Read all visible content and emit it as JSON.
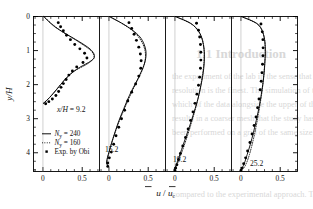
{
  "figure": {
    "background_color": "#ffffff",
    "line_color": "#000000",
    "axis_label_y": "y/H",
    "axis_label_x_num": "u",
    "axis_label_x_den": "u",
    "axis_label_x_den_sub": "c",
    "axis_label_x_slash": "/"
  },
  "axes": {
    "y_ticks": [
      "0",
      "1",
      "2",
      "3",
      "4"
    ],
    "y_tick_values": [
      0,
      1,
      2,
      3,
      4
    ],
    "y_range": [
      0,
      4.55
    ],
    "y_minor_step": 0.25,
    "x_ticks": [
      "0",
      "0.5"
    ],
    "x_tick_values": [
      0,
      0.5
    ],
    "x_range": [
      -0.12,
      0.72
    ],
    "x_minor_step": 0.1
  },
  "legend": {
    "items": [
      {
        "label_pre": "N",
        "label_sub": "y",
        "label_post": " = 240",
        "style": "solid",
        "name": "ny-240"
      },
      {
        "label_pre": "N",
        "label_sub": "y",
        "label_post": " = 160",
        "style": "dotted",
        "name": "ny-160"
      },
      {
        "label_pre": "Exp. by Obi",
        "label_sub": "",
        "label_post": "",
        "style": "marker",
        "name": "exp-obi"
      }
    ]
  },
  "chart_data": {
    "type": "line",
    "title": "",
    "xlabel": "u / u_c",
    "ylabel": "y/H",
    "xlim": [
      -0.12,
      0.72
    ],
    "ylim": [
      0,
      4.55
    ],
    "y_axis_inverted": true,
    "grid": false,
    "legend_position": "lower-left-panel-1",
    "panels": [
      {
        "name": "panel-x-9.2",
        "label_pre": "x/H",
        "label_post": " = 9.2",
        "label_full": "x/H = 9.2",
        "x_over_H": 9.2,
        "series": [
          {
            "name": "Ny = 240",
            "style": "solid",
            "y": [
              0.0,
              0.15,
              0.3,
              0.45,
              0.6,
              0.75,
              0.9,
              1.0,
              1.1,
              1.18,
              1.25,
              1.35,
              1.45,
              1.55,
              1.7,
              1.85,
              2.0,
              2.15,
              2.3,
              2.45,
              2.55
            ],
            "u": [
              0.01,
              0.075,
              0.15,
              0.25,
              0.36,
              0.47,
              0.57,
              0.62,
              0.65,
              0.655,
              0.64,
              0.58,
              0.5,
              0.43,
              0.345,
              0.28,
              0.225,
              0.17,
              0.115,
              0.055,
              0.005
            ]
          },
          {
            "name": "Ny = 160",
            "style": "dotted",
            "y": [
              0.0,
              0.2,
              0.4,
              0.6,
              0.8,
              1.0,
              1.15,
              1.25,
              1.4,
              1.6,
              1.8,
              2.0,
              2.2,
              2.4,
              2.55
            ],
            "u": [
              0.01,
              0.105,
              0.215,
              0.355,
              0.49,
              0.61,
              0.648,
              0.64,
              0.56,
              0.4,
              0.3,
              0.225,
              0.155,
              0.075,
              0.005
            ]
          },
          {
            "name": "Exp. by Obi",
            "style": "marker",
            "y": [
              0.18,
              0.3,
              0.42,
              0.55,
              0.68,
              0.82,
              0.95,
              1.08,
              1.22,
              1.35,
              1.48,
              1.6,
              1.72,
              1.85,
              1.97,
              2.08,
              2.2,
              2.32,
              2.42,
              2.5,
              2.56
            ],
            "u": [
              0.195,
              0.225,
              0.26,
              0.3,
              0.35,
              0.405,
              0.47,
              0.53,
              0.56,
              0.51,
              0.43,
              0.375,
              0.33,
              0.295,
              0.26,
              0.23,
              0.2,
              0.165,
              0.12,
              0.075,
              0.035
            ]
          }
        ]
      },
      {
        "name": "panel-x-15.2",
        "label_pre": "",
        "label_post": "15.2",
        "label_full": "15.2",
        "x_over_H": 15.2,
        "series": [
          {
            "name": "Ny = 240",
            "style": "solid",
            "y": [
              0.0,
              0.2,
              0.4,
              0.6,
              0.8,
              1.0,
              1.2,
              1.4,
              1.6,
              1.8,
              2.0,
              2.2,
              2.45,
              2.7,
              2.95,
              3.2,
              3.45,
              3.7,
              3.95,
              4.15,
              4.3,
              4.38
            ],
            "u": [
              0.005,
              0.165,
              0.3,
              0.395,
              0.445,
              0.47,
              0.47,
              0.45,
              0.415,
              0.375,
              0.33,
              0.285,
              0.235,
              0.19,
              0.145,
              0.105,
              0.07,
              0.035,
              0.005,
              -0.02,
              -0.03,
              -0.015
            ]
          },
          {
            "name": "Ny = 160",
            "style": "dotted",
            "y": [
              0.0,
              0.25,
              0.5,
              0.8,
              1.1,
              1.4,
              1.7,
              2.0,
              2.4,
              2.8,
              3.2,
              3.6,
              4.0,
              4.25,
              4.38
            ],
            "u": [
              0.005,
              0.2,
              0.34,
              0.43,
              0.465,
              0.45,
              0.4,
              0.335,
              0.255,
              0.18,
              0.11,
              0.05,
              0.0,
              -0.025,
              -0.015
            ]
          },
          {
            "name": "Exp. by Obi",
            "style": "marker",
            "y": [
              0.18,
              0.35,
              0.52,
              0.7,
              0.9,
              1.1,
              1.3,
              1.52,
              1.75,
              1.98,
              2.22,
              2.48,
              2.75,
              3.0,
              3.25,
              3.5,
              3.75,
              3.98,
              4.15,
              4.3,
              4.4
            ],
            "u": [
              0.255,
              0.29,
              0.32,
              0.35,
              0.38,
              0.4,
              0.41,
              0.405,
              0.38,
              0.34,
              0.29,
              0.24,
              0.2,
              0.16,
              0.125,
              0.09,
              0.06,
              0.03,
              0.005,
              -0.015,
              -0.015
            ]
          }
        ]
      },
      {
        "name": "panel-x-19.2",
        "label_pre": "",
        "label_post": "19.2",
        "label_full": "19.2",
        "x_over_H": 19.2,
        "series": [
          {
            "name": "Ny = 240",
            "style": "solid",
            "y": [
              0.0,
              0.2,
              0.45,
              0.7,
              0.95,
              1.2,
              1.5,
              1.8,
              2.1,
              2.4,
              2.7,
              3.0,
              3.3,
              3.6,
              3.9,
              4.15,
              4.35,
              4.48,
              4.52
            ],
            "u": [
              0.005,
              0.2,
              0.305,
              0.35,
              0.37,
              0.375,
              0.368,
              0.35,
              0.325,
              0.295,
              0.258,
              0.218,
              0.175,
              0.13,
              0.085,
              0.048,
              0.018,
              -0.01,
              -0.005
            ]
          },
          {
            "name": "Ny = 160",
            "style": "dotted",
            "y": [
              0.0,
              0.25,
              0.55,
              0.9,
              1.25,
              1.6,
              2.0,
              2.4,
              2.8,
              3.2,
              3.6,
              4.0,
              4.3,
              4.5
            ],
            "u": [
              0.005,
              0.23,
              0.33,
              0.368,
              0.372,
              0.358,
              0.33,
              0.295,
              0.25,
              0.2,
              0.145,
              0.085,
              0.035,
              -0.005
            ]
          },
          {
            "name": "Exp. by Obi",
            "style": "marker",
            "y": [
              0.2,
              0.4,
              0.6,
              0.82,
              1.05,
              1.28,
              1.52,
              1.78,
              2.02,
              2.28,
              2.55,
              2.8,
              3.05,
              3.3,
              3.55,
              3.8,
              4.02,
              4.2,
              4.35,
              4.45,
              4.52
            ],
            "u": [
              0.275,
              0.3,
              0.315,
              0.325,
              0.33,
              0.33,
              0.325,
              0.315,
              0.3,
              0.28,
              0.255,
              0.23,
              0.2,
              0.168,
              0.135,
              0.1,
              0.07,
              0.045,
              0.025,
              0.01,
              0.0
            ]
          }
        ]
      },
      {
        "name": "panel-x-25.2",
        "label_pre": "",
        "label_post": "25.2",
        "label_full": "25.2",
        "x_over_H": 25.2,
        "series": [
          {
            "name": "Ny = 240",
            "style": "solid",
            "y": [
              0.0,
              0.2,
              0.45,
              0.75,
              1.05,
              1.35,
              1.65,
              2.0,
              2.35,
              2.7,
              3.05,
              3.4,
              3.75,
              4.05,
              4.3,
              4.45,
              4.52
            ],
            "u": [
              0.005,
              0.2,
              0.275,
              0.305,
              0.31,
              0.305,
              0.295,
              0.278,
              0.255,
              0.228,
              0.195,
              0.16,
              0.12,
              0.08,
              0.045,
              0.015,
              -0.005
            ]
          },
          {
            "name": "Ny = 160",
            "style": "dotted",
            "y": [
              0.0,
              0.25,
              0.6,
              1.0,
              1.4,
              1.8,
              2.2,
              2.6,
              3.0,
              3.4,
              3.8,
              4.15,
              4.4,
              4.52
            ],
            "u": [
              0.005,
              0.225,
              0.295,
              0.31,
              0.302,
              0.288,
              0.268,
              0.242,
              0.212,
              0.178,
              0.138,
              0.095,
              0.05,
              0.0
            ]
          },
          {
            "name": "Exp. by Obi",
            "style": "marker",
            "y": [
              0.22,
              0.45,
              0.68,
              0.92,
              1.15,
              1.4,
              1.65,
              1.9,
              2.15,
              2.42,
              2.68,
              2.95,
              3.2,
              3.45,
              3.7,
              3.95,
              4.15,
              4.32,
              4.45,
              4.52
            ],
            "u": [
              0.255,
              0.272,
              0.28,
              0.282,
              0.28,
              0.275,
              0.268,
              0.258,
              0.245,
              0.23,
              0.212,
              0.192,
              0.168,
              0.142,
              0.115,
              0.085,
              0.06,
              0.035,
              0.015,
              0.0
            ]
          }
        ]
      }
    ]
  },
  "background_text": {
    "lines": [
      {
        "text": "1.1 Introduction",
        "x": 196,
        "y": 46,
        "size": 13,
        "weight": "bold"
      },
      {
        "text": "the experiment of the lab in the sense that the",
        "x": 172,
        "y": 72,
        "size": 8.4,
        "weight": "normal"
      },
      {
        "text": "resolution is the finest. The simulation of the",
        "x": 172,
        "y": 86,
        "size": 8.4,
        "weight": "normal"
      },
      {
        "text": "which of the data alongside the upper of the",
        "x": 172,
        "y": 100,
        "size": 8.4,
        "weight": "normal"
      },
      {
        "text": "results in a coarser mesh that the study has",
        "x": 172,
        "y": 114,
        "size": 8.4,
        "weight": "normal"
      },
      {
        "text": "been performed on a grid of the same size",
        "x": 172,
        "y": 128,
        "size": 8.4,
        "weight": "normal"
      },
      {
        "text": "compared to the experimental approach. To",
        "x": 172,
        "y": 190,
        "size": 8.4,
        "weight": "normal"
      }
    ]
  }
}
